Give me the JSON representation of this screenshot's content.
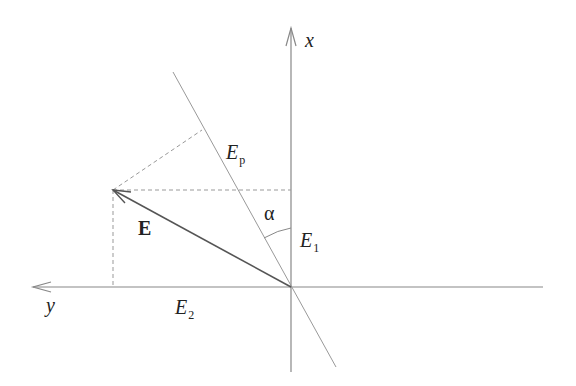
{
  "diagram": {
    "type": "vector-decomposition",
    "colors": {
      "line": "#888888",
      "vector": "#555555",
      "dash": "#999999",
      "text": "#222222"
    },
    "axes": {
      "x_label": "x",
      "y_label": "y"
    },
    "labels": {
      "vector": "E",
      "projection_line_main": "E",
      "projection_line_sub": "p",
      "component1_main": "E",
      "component1_sub": "1",
      "component2_main": "E",
      "component2_sub": "2",
      "angle": "α"
    }
  }
}
